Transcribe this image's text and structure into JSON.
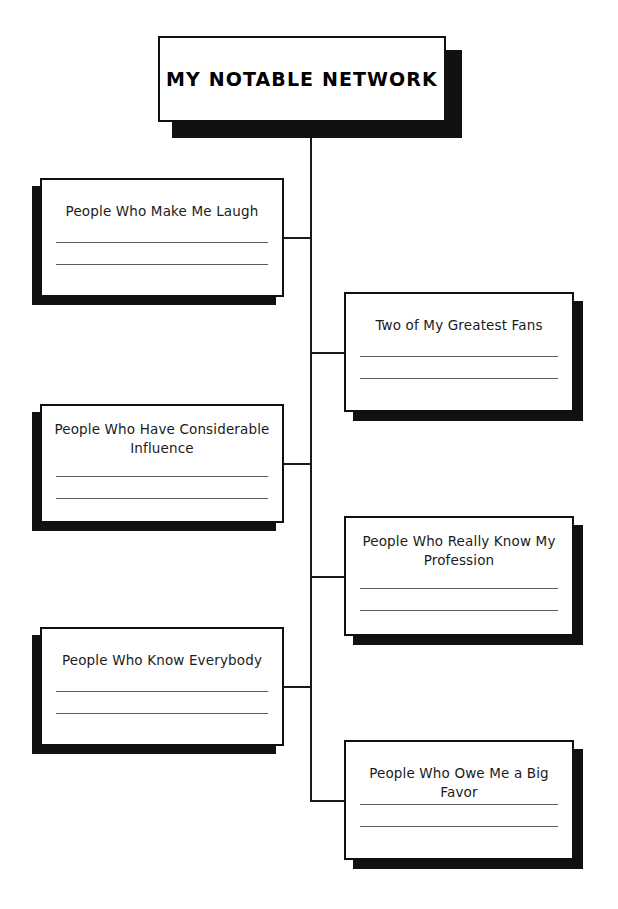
{
  "worksheet": {
    "title": "MY NOTABLE NETWORK",
    "accent_color": "#111111",
    "background_color": "#ffffff",
    "rule_color": "#5c5c5c",
    "border_color": "#101010",
    "layout": "tree-diagram",
    "branch_count": 6
  },
  "nodes": {
    "left": [
      {
        "label": "People Who Make Me Laugh",
        "lines": 2
      },
      {
        "label": "People Who Have Considerable Influence",
        "lines": 2
      },
      {
        "label": "People Who Know Everybody",
        "lines": 2
      }
    ],
    "right": [
      {
        "label": "Two of My Greatest Fans",
        "lines": 2
      },
      {
        "label": "People Who Really Know My Profession",
        "lines": 2
      },
      {
        "label": "People Who Owe Me a Big Favor",
        "lines": 2
      }
    ]
  }
}
